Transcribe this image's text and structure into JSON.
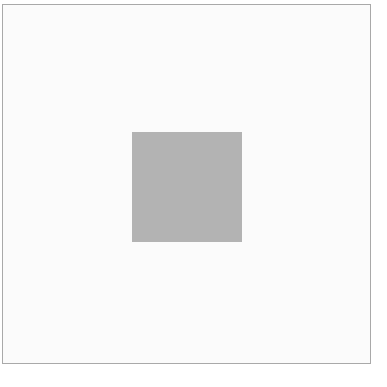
{
  "canvas": {
    "width": 387,
    "height": 387,
    "background": "#ffffff"
  },
  "frame": {
    "border_color": "#a9a9a9",
    "fill_color": "#fbfbfb"
  },
  "shape": {
    "kind": "square",
    "fill_color": "#b3b3b3"
  }
}
